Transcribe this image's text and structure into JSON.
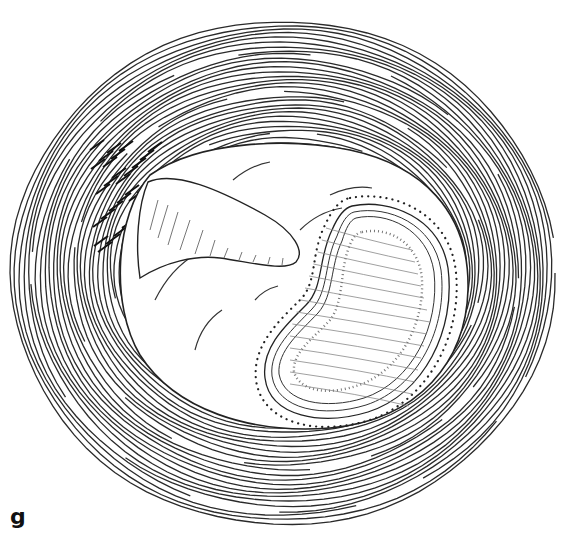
{
  "figure": {
    "panel_label": "g",
    "colors": {
      "line": "#2a2a2a",
      "dark_hatch": "#111111",
      "background": "#ffffff"
    },
    "rings": {
      "count": 30,
      "center_x": 283,
      "center_y": 268,
      "outer_rx": 272,
      "outer_ry": 252,
      "inner_rx": 160,
      "inner_ry": 125
    }
  }
}
